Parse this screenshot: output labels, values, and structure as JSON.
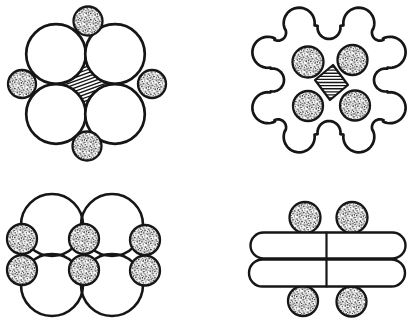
{
  "canvas": {
    "width": 416,
    "height": 324,
    "background": "#ffffff",
    "ink": "#161616"
  },
  "figures": [
    {
      "name": "quad-four-round-conductors",
      "shapes": [
        {
          "kind": "astroid",
          "name": "center-spacer-hatched",
          "centers": [
            [
              56,
              54
            ],
            [
              115,
              54
            ],
            [
              115,
              114
            ],
            [
              56,
              114
            ]
          ],
          "r": 29.8,
          "hatch": {
            "angle": -20,
            "spacing": 3.2,
            "lw": 1.35
          },
          "sw": 1.8
        },
        {
          "kind": "circle",
          "name": "conductor-large",
          "cx": 56,
          "cy": 54,
          "r": 29.8,
          "fill": "white",
          "sw": 2.7
        },
        {
          "kind": "circle",
          "name": "conductor-large",
          "cx": 115,
          "cy": 54,
          "r": 29.8,
          "fill": "white",
          "sw": 2.7
        },
        {
          "kind": "circle",
          "name": "conductor-large",
          "cx": 56,
          "cy": 114,
          "r": 29.8,
          "fill": "white",
          "sw": 2.7
        },
        {
          "kind": "circle",
          "name": "conductor-large",
          "cx": 115,
          "cy": 114,
          "r": 29.8,
          "fill": "white",
          "sw": 2.7
        },
        {
          "kind": "circle",
          "name": "filler-stippled",
          "cx": 88,
          "cy": 21,
          "r": 14.5,
          "fill": "stipple",
          "sw": 2.3
        },
        {
          "kind": "circle",
          "name": "filler-stippled",
          "cx": 22,
          "cy": 84,
          "r": 14,
          "fill": "stipple",
          "sw": 2.3
        },
        {
          "kind": "circle",
          "name": "filler-stippled",
          "cx": 152,
          "cy": 84,
          "r": 14,
          "fill": "stipple",
          "sw": 2.3
        },
        {
          "kind": "circle",
          "name": "filler-stippled",
          "cx": 87,
          "cy": 146,
          "r": 14.5,
          "fill": "stipple",
          "sw": 2.3
        }
      ]
    },
    {
      "name": "quad-lobed-sheath",
      "shapes": [
        {
          "kind": "lobed",
          "name": "sheath-outline",
          "cx": 329,
          "cy": 80,
          "squashY": 0.93,
          "db": 68,
          "rb": 15.5,
          "beta": 19,
          "lobeNotch": {
            "d": 72,
            "r": 8
          },
          "axisNotch": {
            "d": 56.5,
            "r": 11.5
          },
          "sw": 2.7,
          "fill": "white"
        },
        {
          "kind": "circle",
          "name": "conductor-stippled",
          "cx": 308,
          "cy": 62,
          "r": 15.5,
          "fill": "stipple",
          "sw": 2.3
        },
        {
          "kind": "circle",
          "name": "conductor-stippled",
          "cx": 352.5,
          "cy": 60,
          "r": 15,
          "fill": "stipple",
          "sw": 2.3
        },
        {
          "kind": "circle",
          "name": "conductor-stippled",
          "cx": 308,
          "cy": 106,
          "r": 15,
          "fill": "stipple",
          "sw": 2.3
        },
        {
          "kind": "circle",
          "name": "conductor-stippled",
          "cx": 355,
          "cy": 105.5,
          "r": 15,
          "fill": "stipple",
          "sw": 2.3
        },
        {
          "kind": "polygon",
          "name": "center-spacer-hatched",
          "points": [
            [
              333,
              65
            ],
            [
              348,
              85
            ],
            [
              330,
              100
            ],
            [
              315,
              80
            ]
          ],
          "hatch": {
            "angle": 0,
            "spacing": 3.1,
            "lw": 1.35
          },
          "sw": 2.2,
          "fill": "white"
        }
      ]
    },
    {
      "name": "six-conductor-group",
      "shapes": [
        {
          "kind": "circle",
          "name": "insulation-circle",
          "cx": 52,
          "cy": 225,
          "r": 31,
          "fill": "none",
          "sw": 2.6
        },
        {
          "kind": "circle",
          "name": "insulation-circle",
          "cx": 112,
          "cy": 225,
          "r": 31,
          "fill": "none",
          "sw": 2.6
        },
        {
          "kind": "circle",
          "name": "insulation-circle",
          "cx": 52,
          "cy": 285,
          "r": 31,
          "fill": "none",
          "sw": 2.6
        },
        {
          "kind": "circle",
          "name": "insulation-circle",
          "cx": 112,
          "cy": 285,
          "r": 31,
          "fill": "none",
          "sw": 2.6
        },
        {
          "kind": "circle",
          "name": "conductor-stippled",
          "cx": 22,
          "cy": 239,
          "r": 15,
          "fill": "stipple",
          "sw": 2.3
        },
        {
          "kind": "circle",
          "name": "conductor-stippled",
          "cx": 22,
          "cy": 270,
          "r": 15,
          "fill": "stipple",
          "sw": 2.3
        },
        {
          "kind": "circle",
          "name": "conductor-stippled",
          "cx": 84,
          "cy": 239,
          "r": 15,
          "fill": "stipple",
          "sw": 2.3
        },
        {
          "kind": "circle",
          "name": "conductor-stippled",
          "cx": 84,
          "cy": 270,
          "r": 15,
          "fill": "stipple",
          "sw": 2.3
        },
        {
          "kind": "circle",
          "name": "conductor-stippled",
          "cx": 145,
          "cy": 240,
          "r": 15,
          "fill": "stipple",
          "sw": 2.3
        },
        {
          "kind": "circle",
          "name": "conductor-stippled",
          "cx": 145,
          "cy": 270.5,
          "r": 15,
          "fill": "stipple",
          "sw": 2.3
        }
      ]
    },
    {
      "name": "ribbon-pair",
      "shapes": [
        {
          "kind": "circle",
          "name": "conductor-stippled",
          "cx": 305,
          "cy": 217.5,
          "r": 15.5,
          "fill": "stipple",
          "sw": 2.3
        },
        {
          "kind": "circle",
          "name": "conductor-stippled",
          "cx": 352,
          "cy": 217.5,
          "r": 15.5,
          "fill": "stipple",
          "sw": 2.3
        },
        {
          "kind": "circle",
          "name": "conductor-stippled",
          "cx": 303,
          "cy": 301,
          "r": 15,
          "fill": "stipple",
          "sw": 2.3
        },
        {
          "kind": "circle",
          "name": "conductor-stippled",
          "cx": 351.5,
          "cy": 301.5,
          "r": 15,
          "fill": "stipple",
          "sw": 2.3
        },
        {
          "kind": "stadium",
          "name": "ribbon-top",
          "x": 250.5,
          "y": 232.5,
          "w": 155,
          "h": 26,
          "sw": 2.4,
          "fill": "white"
        },
        {
          "kind": "stadium",
          "name": "ribbon-bottom",
          "x": 249,
          "y": 259.5,
          "w": 156,
          "h": 27,
          "sw": 2.4,
          "fill": "white"
        },
        {
          "kind": "line",
          "name": "ribbon-divider",
          "x1": 326.5,
          "y1": 232.5,
          "x2": 326.5,
          "y2": 286.5,
          "sw": 2.2
        }
      ]
    }
  ]
}
